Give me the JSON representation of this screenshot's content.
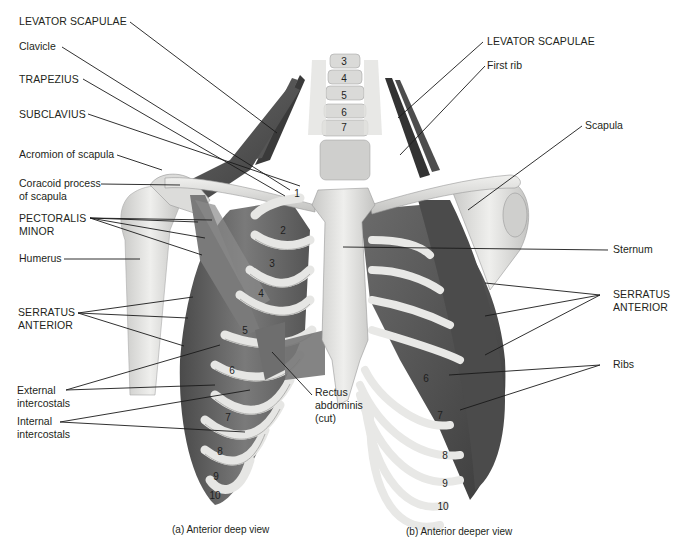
{
  "figure": {
    "panels": [
      {
        "id": "a",
        "caption": "(a) Anterior deep view"
      },
      {
        "id": "b",
        "caption": "(b) Anterior deeper view"
      }
    ]
  },
  "vertebrae": [
    "3",
    "4",
    "5",
    "6",
    "7"
  ],
  "ribs_left": [
    "1",
    "2",
    "3",
    "4",
    "5",
    "6",
    "7",
    "8",
    "9",
    "10"
  ],
  "ribs_right": [
    "6",
    "7",
    "8",
    "9",
    "10"
  ],
  "left_labels": {
    "levator_scapulae": "LEVATOR SCAPULAE",
    "clavicle": "Clavicle",
    "trapezius": "TRAPEZIUS",
    "subclavius": "SUBCLAVIUS",
    "acromion": "Acromion of scapula",
    "coracoid": "Coracoid process\nof scapula",
    "pectoralis_minor": "PECTORALIS\nMINOR",
    "humerus": "Humerus",
    "serratus_anterior": "SERRATUS\nANTERIOR",
    "external_intercostals": "External\nintercostals",
    "internal_intercostals": "Internal\nintercostals"
  },
  "center_labels": {
    "rectus_abdominis": "Rectus\nabdominis\n(cut)"
  },
  "right_labels": {
    "levator_scapulae": "LEVATOR SCAPULAE",
    "first_rib": "First rib",
    "scapula": "Scapula",
    "sternum": "Sternum",
    "serratus_anterior": "SERRATUS\nANTERIOR",
    "ribs": "Ribs"
  },
  "colors": {
    "bone": "#e4e4e2",
    "bone_shade": "#b9b9b7",
    "muscle": "#5f5f5f",
    "muscle_dark": "#3d3d3d",
    "leader": "#1a1a1a",
    "background": "#ffffff"
  }
}
